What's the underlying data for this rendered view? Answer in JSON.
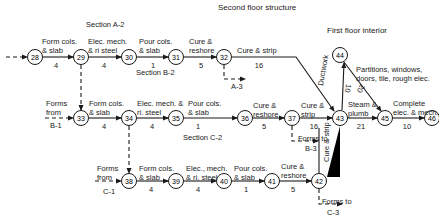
{
  "title": "Second floor structure",
  "subtitle": "First floor interior",
  "sections": {
    "a2": "Section A-2",
    "b2": "Section B-2",
    "c2": "Section C-2"
  },
  "nodes": [
    {
      "id": "28",
      "x": 35,
      "y": 57
    },
    {
      "id": "29",
      "x": 81,
      "y": 57
    },
    {
      "id": "30",
      "x": 129,
      "y": 57
    },
    {
      "id": "31",
      "x": 176,
      "y": 57
    },
    {
      "id": "32",
      "x": 224,
      "y": 57
    },
    {
      "id": "33",
      "x": 81,
      "y": 118
    },
    {
      "id": "34",
      "x": 129,
      "y": 118
    },
    {
      "id": "35",
      "x": 176,
      "y": 118
    },
    {
      "id": "36",
      "x": 245,
      "y": 118
    },
    {
      "id": "37",
      "x": 292,
      "y": 118
    },
    {
      "id": "43",
      "x": 340,
      "y": 118
    },
    {
      "id": "44",
      "x": 340,
      "y": 55
    },
    {
      "id": "45",
      "x": 385,
      "y": 118
    },
    {
      "id": "46",
      "x": 432,
      "y": 118
    },
    {
      "id": "38",
      "x": 129,
      "y": 181
    },
    {
      "id": "39",
      "x": 176,
      "y": 181
    },
    {
      "id": "40",
      "x": 224,
      "y": 181
    },
    {
      "id": "41",
      "x": 272,
      "y": 181
    },
    {
      "id": "42",
      "x": 319,
      "y": 181
    }
  ],
  "activities": {
    "a28_29": {
      "l1": "Form cols.",
      "l2": "& slab",
      "d": "4"
    },
    "a29_30": {
      "l1": "Elec. mech.",
      "l2": "& ri steel",
      "d": "4"
    },
    "a30_31": {
      "l1": "Pour cols.",
      "l2": "& slab",
      "d": "1"
    },
    "a31_32": {
      "l1": "Cure &",
      "l2": "reshore",
      "d": "5"
    },
    "a32_43": {
      "l1": "Cure & strip",
      "d": "16"
    },
    "a33_34": {
      "l1": "Form cols.",
      "l2": "& slab",
      "d": "4"
    },
    "a34_35": {
      "l1": "Elec. mech. &",
      "l2": "ri. steel",
      "d": "4"
    },
    "a35_36": {
      "l1": "Pour cols.",
      "l2": "& slab",
      "d": "1"
    },
    "a36_37": {
      "l1": "Cure &",
      "l2": "reshore",
      "d": "5"
    },
    "a37_43": {
      "l1": "Cure &",
      "l2": "strip",
      "d": "16"
    },
    "a43_44": {
      "l1": "Ductwork",
      "d": "10"
    },
    "a44_45": {
      "l1": "Partitions, windows,",
      "l2": "doors, tile, rough elec.",
      "d": "20"
    },
    "a43_45": {
      "l1": "Steam &",
      "l2": "plumb",
      "d": "21"
    },
    "a45_46": {
      "l1": "Complete",
      "l2": "elec. & mech.",
      "d": "10"
    },
    "a38_39": {
      "l1": "Form cols.",
      "l2": "& slab",
      "d": "4"
    },
    "a39_40": {
      "l1": "Elec., mech.",
      "l2": "& ri. steel",
      "d": "4"
    },
    "a40_41": {
      "l1": "Pour cols.",
      "l2": "& slab",
      "d": "1"
    },
    "a41_42": {
      "l1": "Cure &",
      "l2": "reshore",
      "d": "5"
    },
    "a42_43": {
      "l1": "Cure &",
      "l2": "strip"
    }
  },
  "external": {
    "forms_from_b1": {
      "l1": "Forms",
      "l2": "from",
      "l3": "B-1"
    },
    "forms_from_c1": {
      "l1": "Forms",
      "l2": "from",
      "l3": "C-1"
    },
    "to_a3": "A-3",
    "forms_to_b3": {
      "l1": "Forms to",
      "l2": "B-3"
    },
    "forms_to_c3": {
      "l1": "Forms to",
      "l2": "C-3"
    }
  },
  "colors": {
    "line": "#1a1a1a",
    "background": "#ffffff"
  }
}
